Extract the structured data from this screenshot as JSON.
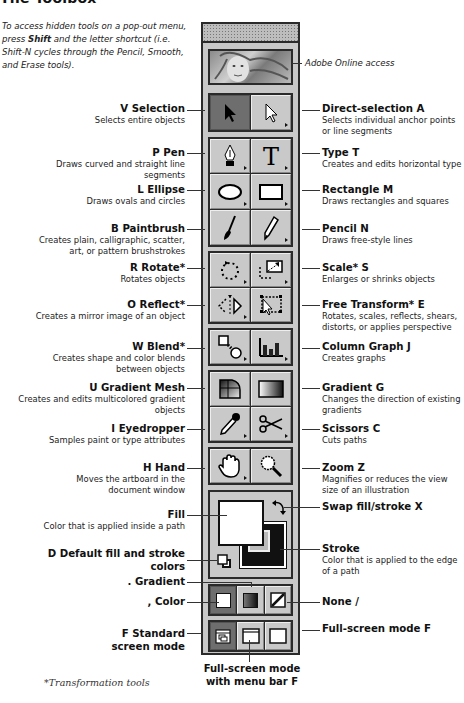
{
  "title": "The Toolbox",
  "intro": {
    "part1": "To access hidden tools on a pop-out menu, press ",
    "bold": "Shift",
    "part2": " and the letter shortcut (i.e. Shift-N cycles through the Pencil, Smooth, and Erase tools)."
  },
  "labels": {
    "adobe_online": "Adobe Online access",
    "selection": {
      "key": "V",
      "name": "Selection",
      "desc": "Selects entire objects"
    },
    "direct_selection": {
      "key": "A",
      "name": "Direct-selection",
      "desc": "Selects individual anchor points or line segments"
    },
    "pen": {
      "key": "P",
      "name": "Pen",
      "desc": "Draws curved and straight line segments"
    },
    "type": {
      "key": "T",
      "name": "Type",
      "desc": "Creates and edits horizontal type"
    },
    "ellipse": {
      "key": "L",
      "name": "Ellipse",
      "desc": "Draws ovals and circles"
    },
    "rectangle": {
      "key": "M",
      "name": "Rectangle",
      "desc": "Draws rectangles and squares"
    },
    "paintbrush": {
      "key": "B",
      "name": "Paintbrush",
      "desc": "Creates plain, calligraphic, scatter, art, or pattern brushstrokes"
    },
    "pencil": {
      "key": "N",
      "name": "Pencil",
      "desc": "Draws free-style lines"
    },
    "rotate": {
      "key": "R",
      "name": "Rotate*",
      "desc": "Rotates objects"
    },
    "scale": {
      "key": "S",
      "name": "Scale*",
      "desc": "Enlarges or shrinks objects"
    },
    "reflect": {
      "key": "O",
      "name": "Reflect*",
      "desc": "Creates a mirror image of an object"
    },
    "free_transform": {
      "key": "E",
      "name": "Free Transform*",
      "desc": "Rotates, scales, reflects, shears, distorts, or applies perspective"
    },
    "blend": {
      "key": "W",
      "name": "Blend*",
      "desc": "Creates shape and color blends between objects"
    },
    "column_graph": {
      "key": "J",
      "name": "Column Graph",
      "desc": "Creates graphs"
    },
    "gradient_mesh": {
      "key": "U",
      "name": "Gradient Mesh",
      "desc": "Creates and edits multicolored gradient objects"
    },
    "gradient": {
      "key": "G",
      "name": "Gradient",
      "desc": "Changes the direction of existing gradients"
    },
    "eyedropper": {
      "key": "I",
      "name": "Eyedropper",
      "desc": "Samples paint or type attributes"
    },
    "scissors": {
      "key": "C",
      "name": "Scissors",
      "desc": "Cuts paths"
    },
    "hand": {
      "key": "H",
      "name": "Hand",
      "desc": "Moves the artboard in the document window"
    },
    "zoom": {
      "key": "Z",
      "name": "Zoom",
      "desc": "Magnifies or reduces the view size of an illustration"
    },
    "fill": {
      "name": "Fill",
      "desc": "Color that is applied inside a path"
    },
    "swap": {
      "name": "Swap fill/stroke",
      "key": "X"
    },
    "default_colors": {
      "key": "D",
      "name": "Default fill and stroke colors"
    },
    "stroke": {
      "name": "Stroke",
      "desc": "Color that is applied to the edge of a path"
    },
    "gradient_mode": {
      "key": ".",
      "name": "Gradient"
    },
    "color_mode": {
      "key": ",",
      "name": "Color"
    },
    "none_mode": {
      "name": "None",
      "key": "/"
    },
    "standard_screen": {
      "key": "F",
      "name": "Standard screen mode"
    },
    "full_screen_menu": {
      "name": "Full-screen mode with menu bar",
      "key": "F"
    },
    "full_screen": {
      "name": "Full-screen mode",
      "key": "F"
    }
  },
  "footnote": "*Transformation tools"
}
